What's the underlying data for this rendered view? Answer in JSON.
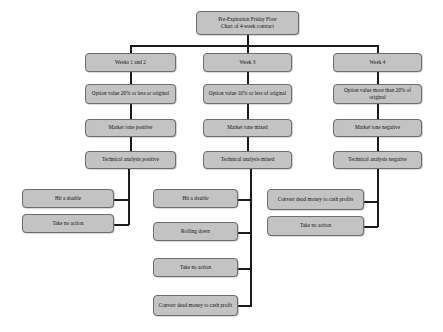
{
  "diagram": {
    "title_box": {
      "line1": "Pre-Expiration Friday Flow",
      "line2": "Chart of 4-week contract"
    },
    "columns": [
      {
        "id": "weeks-1-2",
        "header": "Weeks 1 and 2",
        "option_value": "Option value 20% or less or original",
        "market_tone": "Market tone positive",
        "technical_analysis": "Technical analysis positive",
        "actions": [
          "Hit a double",
          "Take no action"
        ]
      },
      {
        "id": "week-3",
        "header": "Week 3",
        "option_value": "Option value 10% or less of original",
        "market_tone": "Market tone mixed",
        "technical_analysis": "Technical analysis mixed",
        "actions": [
          "Hit a double",
          "Rolling down",
          "Take no action",
          "Convert dead money to cash profit"
        ]
      },
      {
        "id": "week-4",
        "header": "Week 4",
        "option_value": "Option value more than 20% of original",
        "market_tone": "Market tone negative",
        "technical_analysis": "Technical analysis negative",
        "actions": [
          "Convert dead money to cash profits",
          "Take no action"
        ]
      }
    ],
    "style": {
      "node_fill": "#c3c3c3",
      "node_border": "#6d6d6d",
      "edge_color": "#1b1b1b",
      "background": "#ffffff"
    }
  }
}
